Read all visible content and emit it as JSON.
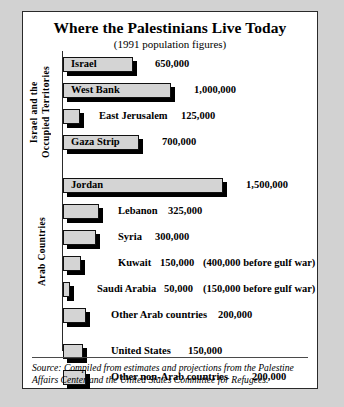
{
  "chart_data": {
    "type": "bar",
    "orientation": "horizontal",
    "title": "Where the Palestinians Live Today",
    "subtitle": "(1991 population figures)",
    "xlabel": "",
    "ylabel": "",
    "xlim": [
      0,
      1500000
    ],
    "grid": false,
    "legend": null,
    "categories": [
      "Israel",
      "West Bank",
      "East Jerusalem",
      "Gaza Strip",
      "Jordan",
      "Lebanon",
      "Syria",
      "Kuwait",
      "Saudi Arabia",
      "Other Arab countries",
      "United States",
      "Other non-Arab countries"
    ],
    "values": [
      650000,
      1000000,
      125000,
      700000,
      1500000,
      325000,
      300000,
      150000,
      50000,
      200000,
      150000,
      200000
    ],
    "value_labels": [
      "650,000",
      "1,000,000",
      "125,000",
      "700,000",
      "1,500,000",
      "325,000",
      "300,000",
      "150,000",
      "50,000",
      "200,000",
      "150,000",
      "200,000"
    ],
    "annotations": [
      "",
      "",
      "",
      "",
      "",
      "",
      "",
      "(400,000 before gulf war)",
      "(150,000 before gulf war)",
      "",
      "",
      ""
    ],
    "groups": [
      {
        "label": "Israel and the\nOccupied Territories",
        "rows": [
          0,
          1,
          2,
          3
        ]
      },
      {
        "label": "Arab Countries",
        "rows": [
          4,
          5,
          6,
          7,
          8,
          9
        ]
      },
      {
        "label": "",
        "rows": [
          10,
          11
        ]
      }
    ],
    "source": "Source: Compiled from estimates and projections from the Palestine Affairs Center and the United States Committee for Refugees."
  },
  "rows": [
    {
      "name": "Israel",
      "value_label": "650,000",
      "note": "",
      "width": 70,
      "label_inside": true,
      "label_left": 8,
      "value_left": 92
    },
    {
      "name": "West Bank",
      "value_label": "1,000,000",
      "note": "",
      "width": 108,
      "label_inside": true,
      "label_left": 8,
      "value_left": 131
    },
    {
      "name": "East Jerusalem",
      "value_label": "125,000",
      "note": "",
      "width": 17,
      "label_inside": false,
      "label_left": 36,
      "value_left": 118
    },
    {
      "name": "Gaza Strip",
      "value_label": "700,000",
      "note": "",
      "width": 76,
      "label_inside": true,
      "label_left": 8,
      "value_left": 99
    },
    {
      "name": "Jordan",
      "value_label": "1,500,000",
      "note": "",
      "width": 160,
      "label_inside": true,
      "label_left": 8,
      "value_left": 183
    },
    {
      "name": "Lebanon",
      "value_label": "325,000",
      "note": "",
      "width": 36,
      "label_inside": false,
      "label_left": 55,
      "value_left": 105
    },
    {
      "name": "Syria",
      "value_label": "300,000",
      "note": "",
      "width": 33,
      "label_inside": false,
      "label_left": 55,
      "value_left": 92
    },
    {
      "name": "Kuwait",
      "value_label": "150,000",
      "note": "(400,000 before gulf war)",
      "width": 18,
      "label_inside": false,
      "label_left": 55,
      "value_left": 97,
      "note_left": 140
    },
    {
      "name": "Saudi Arabia",
      "value_label": "50,000",
      "note": "(150,000 before gulf war)",
      "width": 7,
      "label_inside": false,
      "label_left": 34,
      "value_left": 101,
      "note_left": 140
    },
    {
      "name": "Other Arab countries",
      "value_label": "200,000",
      "note": "",
      "width": 23,
      "label_inside": false,
      "label_left": 48,
      "value_left": 155
    },
    {
      "name": "United States",
      "value_label": "150,000",
      "note": "",
      "width": 20,
      "label_inside": false,
      "label_left": 48,
      "value_left": 125
    },
    {
      "name": "Other non-Arab countries",
      "value_label": "200,000",
      "note": "",
      "width": 23,
      "label_inside": false,
      "label_left": 48,
      "value_left": 189
    }
  ],
  "group_labels": [
    "Israel and the\nOccupied Territories",
    "Arab Countries"
  ],
  "header": {
    "title": "Where the Palestinians Live Today",
    "subtitle": "(1991 population figures)"
  },
  "footer": {
    "source": "Source: Compiled from estimates and projections from the Palestine Affairs Center and the United States Committee for Refugees."
  }
}
